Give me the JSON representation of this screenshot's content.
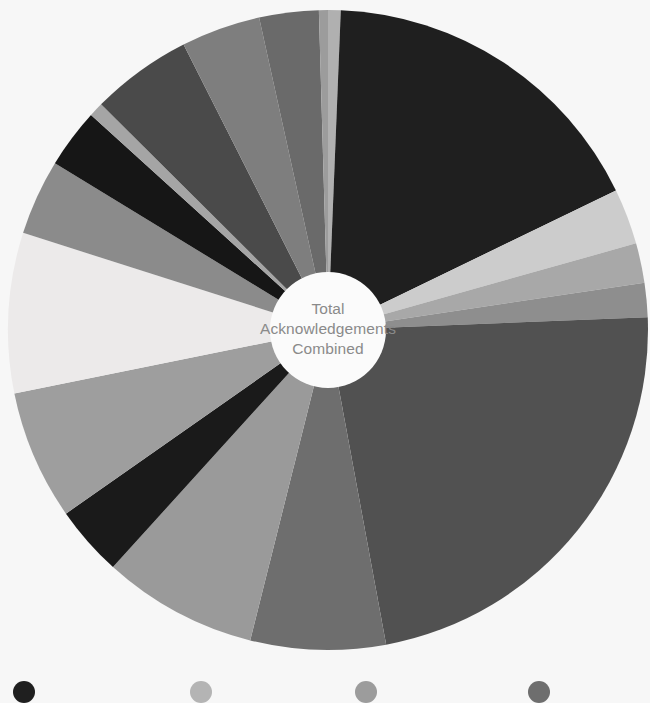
{
  "background_color": "#f7f7f7",
  "center_label": {
    "line1": "Total",
    "line2": "Acknowledgements",
    "line3": "Combined",
    "text_color": "#8a8a8a",
    "hole_color": "#fbfbfb"
  },
  "chart_data": {
    "type": "pie",
    "title": "Total Acknowledgements Combined",
    "subtitle": "",
    "xlabel": "",
    "ylabel": "",
    "variant": "donut",
    "hole_ratio": 0.18,
    "start_angle_deg": 0,
    "direction": "clockwise",
    "grid": false,
    "legend_position": "bottom",
    "center": {
      "cx": 328,
      "cy": 330,
      "r": 320
    },
    "total_percent": 100,
    "labels": [
      "Slice 1",
      "Slice 2",
      "Slice 3",
      "Slice 4",
      "Slice 5",
      "Slice 6",
      "Slice 7",
      "Slice 8",
      "Slice 9",
      "Slice 10",
      "Slice 11",
      "Slice 12",
      "Slice 13",
      "Slice 14",
      "Slice 15",
      "Slice 16",
      "Slice 17",
      "Slice 18"
    ],
    "values": [
      0.7,
      18.9,
      3.1,
      2.2,
      1.9,
      25.0,
      7.5,
      8.6,
      3.9,
      7.2,
      8.9,
      4.2,
      3.3,
      0.8,
      5.6,
      4.4,
      3.3,
      0.5
    ],
    "colors": [
      "#b0b0b0",
      "#1f1f1f",
      "#cccccc",
      "#a8a8a8",
      "#8e8e8e",
      "#515151",
      "#6e6e6e",
      "#9a9a9a",
      "#1a1a1a",
      "#9e9e9e",
      "#eceaea",
      "#8b8b8b",
      "#161616",
      "#a5a5a5",
      "#4a4a4a",
      "#7e7e7e",
      "#6a6a6a",
      "#9c9c9c"
    ]
  },
  "legend": {
    "items": [
      {
        "color": "#1f1f1f",
        "x": 13,
        "label": ""
      },
      {
        "color": "#b4b4b4",
        "x": 190,
        "label": ""
      },
      {
        "color": "#9c9c9c",
        "x": 355,
        "label": ""
      },
      {
        "color": "#6e6e6e",
        "x": 528,
        "label": ""
      }
    ]
  }
}
